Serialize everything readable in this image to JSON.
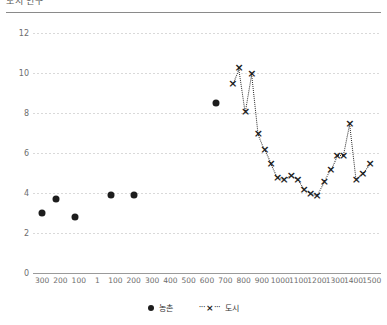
{
  "header": {
    "title": "도시 인구",
    "divider": true
  },
  "legend": {
    "position": "bottom-center",
    "items": [
      {
        "label": "농촌",
        "marker": "filled-circle",
        "color": "#1d1d1d"
      },
      {
        "label": "도시",
        "marker": "dotted-line-x",
        "color": "#1d1d1d"
      }
    ]
  },
  "chart_data": {
    "type": "scatter",
    "title": "도시 인구",
    "xlabel": "",
    "ylabel": "",
    "xlim": [
      -350,
      1550
    ],
    "ylim": [
      0,
      12
    ],
    "grid": true,
    "yticks": [
      0,
      2,
      4,
      6,
      8,
      10,
      12
    ],
    "ytick_labels": [
      "0",
      "2",
      "4",
      "6",
      "8",
      "10",
      "12"
    ],
    "xticks": [
      -300,
      -200,
      -100,
      1,
      100,
      200,
      300,
      400,
      500,
      600,
      700,
      800,
      900,
      1000,
      1100,
      1200,
      1300,
      1400,
      1500
    ],
    "xtick_labels": [
      "300",
      "200",
      "100",
      "1",
      "100",
      "200",
      "300",
      "400",
      "500",
      "600",
      "700",
      "800",
      "900",
      "1000",
      "1100",
      "1200",
      "1300",
      "1400",
      "1500"
    ],
    "series": [
      {
        "name": "농촌",
        "type": "scatter",
        "marker": "filled-circle",
        "color": "#1d1d1d",
        "points": [
          {
            "x": -300,
            "y": 3.0
          },
          {
            "x": -225,
            "y": 3.7
          },
          {
            "x": -120,
            "y": 2.8
          },
          {
            "x": 75,
            "y": 3.9
          },
          {
            "x": 200,
            "y": 3.9
          },
          {
            "x": 650,
            "y": 8.5
          }
        ]
      },
      {
        "name": "도시",
        "type": "line",
        "linestyle": "dotted",
        "marker": "x",
        "color": "#1d1d1d",
        "points": [
          {
            "x": 740,
            "y": 9.5
          },
          {
            "x": 775,
            "y": 10.3
          },
          {
            "x": 810,
            "y": 8.1
          },
          {
            "x": 845,
            "y": 10.0
          },
          {
            "x": 880,
            "y": 7.0
          },
          {
            "x": 915,
            "y": 6.2
          },
          {
            "x": 950,
            "y": 5.5
          },
          {
            "x": 985,
            "y": 4.8
          },
          {
            "x": 1020,
            "y": 4.7
          },
          {
            "x": 1060,
            "y": 4.9
          },
          {
            "x": 1095,
            "y": 4.7
          },
          {
            "x": 1130,
            "y": 4.2
          },
          {
            "x": 1165,
            "y": 4.0
          },
          {
            "x": 1200,
            "y": 3.9
          },
          {
            "x": 1240,
            "y": 4.6
          },
          {
            "x": 1275,
            "y": 5.2
          },
          {
            "x": 1310,
            "y": 5.9
          },
          {
            "x": 1345,
            "y": 5.9
          },
          {
            "x": 1380,
            "y": 7.5
          },
          {
            "x": 1415,
            "y": 4.7
          },
          {
            "x": 1450,
            "y": 5.0
          },
          {
            "x": 1490,
            "y": 5.5
          }
        ]
      }
    ]
  }
}
